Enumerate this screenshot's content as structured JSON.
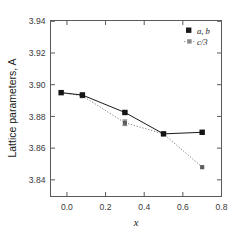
{
  "chart_data": {
    "type": "line",
    "title": "",
    "subtitle": "",
    "xlabel": "x",
    "ylabel": "Lattice parameters, A",
    "xlim": [
      -0.085,
      0.8
    ],
    "ylim": [
      3.8295,
      3.9405
    ],
    "xticks": [
      "0.0",
      "0.2",
      "0.4",
      "0.6",
      "0.8"
    ],
    "xtick_values": [
      0.0,
      0.2,
      0.4,
      0.6,
      0.8
    ],
    "yticks": [
      "3.84",
      "3.86",
      "3.88",
      "3.90",
      "3.92",
      "3.94"
    ],
    "ytick_values": [
      3.84,
      3.86,
      3.88,
      3.9,
      3.92,
      3.94
    ],
    "grid": false,
    "legend_position": "top-right",
    "x": [
      -0.03,
      0.08,
      0.3,
      0.5,
      0.7
    ],
    "series": [
      {
        "name": "a, b",
        "legend_label_1": "a,",
        "legend_label_2": "b",
        "linestyle": "solid",
        "marker": "filled-square",
        "color": "#1a1a1a",
        "values": [
          3.895,
          3.8935,
          3.8825,
          3.869,
          3.87
        ],
        "errors": [
          0.0,
          0.0012,
          0.0008,
          0.0,
          0.0
        ]
      },
      {
        "name": "c/3",
        "legend_label_1": "c/3",
        "legend_label_2": "",
        "linestyle": "dotted",
        "marker": "small-square",
        "color": "#6e6e6e",
        "values": [
          3.895,
          3.893,
          3.876,
          3.869,
          3.848
        ],
        "errors": [
          0.0,
          0.0012,
          0.0018,
          0.0,
          0.0
        ]
      }
    ]
  },
  "legend": {
    "entries": [
      {
        "label": "a, b",
        "marker": "filled-square"
      },
      {
        "label": "c/3",
        "marker": "dotted-line-square"
      }
    ]
  },
  "colors": {
    "frame": "#5a5a5a",
    "series_ab": "#1a1a1a",
    "series_c3": "#7a7a7a",
    "background": "#ffffff"
  }
}
